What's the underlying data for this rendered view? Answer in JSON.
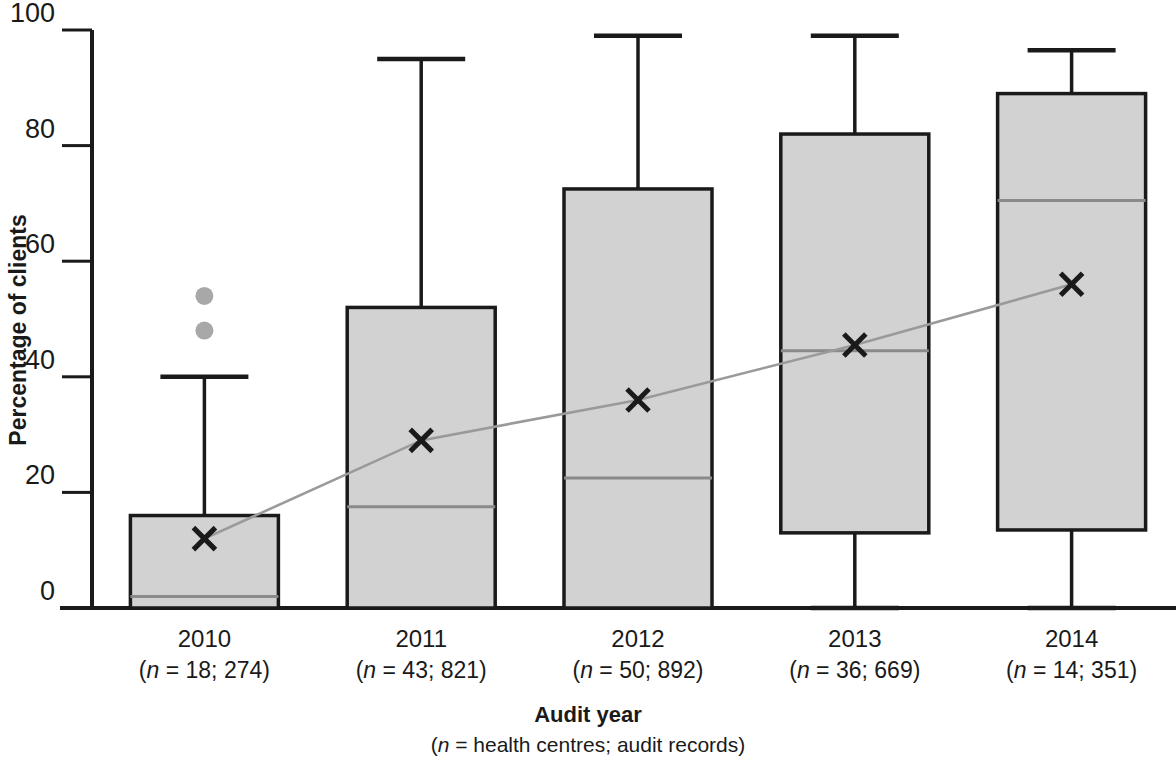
{
  "chart_data": {
    "type": "box",
    "title": "",
    "xlabel": "Audit year",
    "xlabel_sub": "(n = health centres; audit records)",
    "ylabel": "Percentage of clients",
    "ylim": [
      0,
      100
    ],
    "yticks": [
      0,
      20,
      40,
      60,
      80,
      100
    ],
    "ytick_labels": [
      "0",
      "20",
      "40",
      "60",
      "80",
      "100"
    ],
    "grid": false,
    "legend": "none",
    "categories": [
      "2010",
      "2011",
      "2012",
      "2013",
      "2014"
    ],
    "category_sublabels": [
      "(n = 18; 274)",
      "(n = 43; 821)",
      "(n = 50; 892)",
      "(n = 36; 669)",
      "(n = 14; 351)"
    ],
    "category_n_health_centres": [
      18,
      43,
      50,
      36,
      14
    ],
    "category_n_audit_records": [
      274,
      821,
      892,
      669,
      351
    ],
    "boxes": [
      {
        "category": "2010",
        "whisker_low": 0,
        "q1": 0,
        "median": 2,
        "q3": 16,
        "whisker_high": 40,
        "mean": 12,
        "outliers": [
          48,
          54
        ]
      },
      {
        "category": "2011",
        "whisker_low": 0,
        "q1": 0,
        "median": 17.5,
        "q3": 52,
        "whisker_high": 95,
        "mean": 29,
        "outliers": []
      },
      {
        "category": "2012",
        "whisker_low": 0,
        "q1": 0,
        "median": 22.5,
        "q3": 72.5,
        "whisker_high": 99,
        "mean": 36,
        "outliers": []
      },
      {
        "category": "2013",
        "whisker_low": 0,
        "q1": 13,
        "median": 44.5,
        "q3": 82,
        "whisker_high": 99,
        "mean": 45.5,
        "outliers": []
      },
      {
        "category": "2014",
        "whisker_low": 0,
        "q1": 13.5,
        "median": 70.5,
        "q3": 89,
        "whisker_high": 96.5,
        "mean": 56,
        "outliers": []
      }
    ],
    "mean_series": {
      "name": "Mean",
      "marker": "x",
      "values": [
        12,
        29,
        36,
        45.5,
        56
      ]
    },
    "colors": {
      "box_fill": "#d2d2d2",
      "box_stroke": "#1a1a1a",
      "median": "#8a8a8a",
      "mean_line": "#9a9a9a",
      "outlier": "#a8a8a8",
      "text": "#1a1a1a"
    }
  }
}
